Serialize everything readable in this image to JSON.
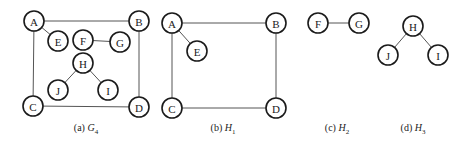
{
  "figure": {
    "panels": [
      {
        "id": "a",
        "caption_prefix": "(a)",
        "caption_var": "G",
        "caption_sub": "4",
        "nodes": [
          {
            "label": "A",
            "x": 34,
            "y": 21
          },
          {
            "label": "B",
            "x": 139,
            "y": 21
          },
          {
            "label": "E",
            "x": 58,
            "y": 41
          },
          {
            "label": "F",
            "x": 83,
            "y": 40
          },
          {
            "label": "G",
            "x": 120,
            "y": 42
          },
          {
            "label": "H",
            "x": 83,
            "y": 63
          },
          {
            "label": "J",
            "x": 58,
            "y": 90
          },
          {
            "label": "I",
            "x": 108,
            "y": 90
          },
          {
            "label": "C",
            "x": 33,
            "y": 106
          },
          {
            "label": "D",
            "x": 139,
            "y": 107
          }
        ],
        "edges": [
          [
            "A",
            "B"
          ],
          [
            "A",
            "C"
          ],
          [
            "B",
            "D"
          ],
          [
            "C",
            "D"
          ],
          [
            "A",
            "E"
          ],
          [
            "F",
            "G"
          ],
          [
            "H",
            "J"
          ],
          [
            "H",
            "I"
          ]
        ],
        "caption_x": 86,
        "caption_y": 122
      },
      {
        "id": "b",
        "caption_prefix": "(b)",
        "caption_var": "H",
        "caption_sub": "1",
        "nodes": [
          {
            "label": "A",
            "x": 172,
            "y": 23
          },
          {
            "label": "B",
            "x": 276,
            "y": 23
          },
          {
            "label": "E",
            "x": 197,
            "y": 51
          },
          {
            "label": "C",
            "x": 172,
            "y": 108
          },
          {
            "label": "D",
            "x": 276,
            "y": 108
          }
        ],
        "edges": [
          [
            "A",
            "B"
          ],
          [
            "A",
            "C"
          ],
          [
            "B",
            "D"
          ],
          [
            "C",
            "D"
          ],
          [
            "A",
            "E"
          ]
        ],
        "caption_x": 223,
        "caption_y": 122
      },
      {
        "id": "c",
        "caption_prefix": "(c)",
        "caption_var": "H",
        "caption_sub": "2",
        "nodes": [
          {
            "label": "F",
            "x": 318,
            "y": 23
          },
          {
            "label": "G",
            "x": 359,
            "y": 23
          }
        ],
        "edges": [
          [
            "F",
            "G"
          ]
        ],
        "caption_x": 337,
        "caption_y": 122
      },
      {
        "id": "d",
        "caption_prefix": "(d)",
        "caption_var": "H",
        "caption_sub": "3",
        "nodes": [
          {
            "label": "H",
            "x": 413,
            "y": 26
          },
          {
            "label": "J",
            "x": 388,
            "y": 55
          },
          {
            "label": "I",
            "x": 438,
            "y": 55
          }
        ],
        "edges": [
          [
            "H",
            "J"
          ],
          [
            "H",
            "I"
          ]
        ],
        "caption_x": 413,
        "caption_y": 122
      }
    ],
    "node_radius": 10
  }
}
